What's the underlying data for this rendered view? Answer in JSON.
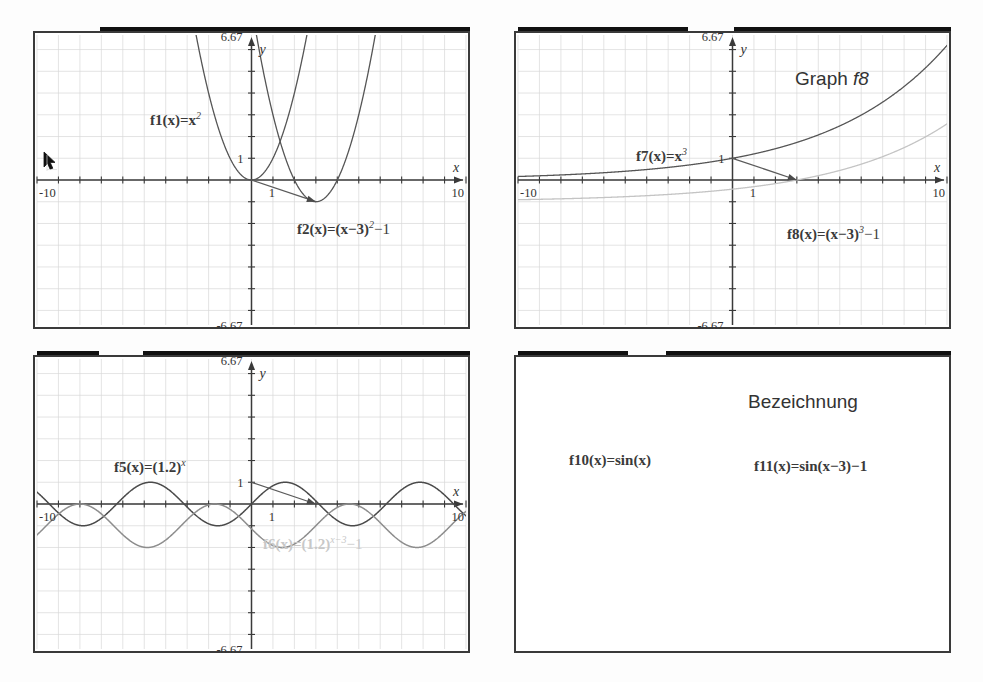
{
  "page": {
    "background": "#fdfdfd",
    "width": 983,
    "height": 682,
    "cursor_icon": "mouse-pointer-icon"
  },
  "axis_defaults": {
    "x_min_label": "-10",
    "x_max_label": "10",
    "y_max_label": "6.67",
    "y_min_label": "-6.67",
    "one_label": "1",
    "x_axis_name": "x",
    "y_axis_name": "y",
    "xlim": [
      -10,
      10
    ],
    "ylim": [
      -6.67,
      6.67
    ],
    "grid": true,
    "grid_step": 1
  },
  "panels": [
    {
      "id": "panel-quadratic",
      "title": "",
      "labels": {
        "f_base": "f1(x)=x",
        "f_base_exp": "2",
        "f_shift_head": "f2(x)=(x−3)",
        "f_shift_exp": "2",
        "f_shift_tail": "−1"
      },
      "chart_data": {
        "type": "line",
        "title": "",
        "xlabel": "x",
        "ylabel": "y",
        "xlim": [
          -10,
          10
        ],
        "ylim": [
          -6.67,
          6.67
        ],
        "grid": true,
        "legend": "inline-annotations",
        "xticks": [
          -10,
          1,
          10
        ],
        "yticks": [
          -6.67,
          1,
          6.67
        ],
        "annotations": [
          {
            "text": "f1(x)=x^2",
            "x": -4.2,
            "y": 4.2
          },
          {
            "text": "f2(x)=(x-3)^2-1",
            "x": 2.2,
            "y": -2.1
          }
        ],
        "arrow": {
          "from": [
            0,
            0
          ],
          "to": [
            3,
            -1
          ],
          "label": "shift vector"
        },
        "series": [
          {
            "name": "f1(x)=x^2",
            "expression": "x^2",
            "color": "#555555",
            "width": 1.3
          },
          {
            "name": "f2(x)=(x-3)^2-1",
            "expression": "(x-3)^2-1",
            "color": "#555555",
            "width": 1.3
          }
        ]
      }
    },
    {
      "id": "panel-cubic",
      "title": "Graph ",
      "title_italic": "f8",
      "labels": {
        "f_base": "f7(x)=x",
        "f_base_exp": "3",
        "f_shift_head": "f8(x)=(x−3)",
        "f_shift_exp": "3",
        "f_shift_tail": "−1"
      },
      "chart_data": {
        "type": "line",
        "title": "Graph f8",
        "xlabel": "x",
        "ylabel": "y",
        "xlim": [
          -10,
          10
        ],
        "ylim": [
          -6.67,
          6.67
        ],
        "grid": true,
        "legend": "inline-annotations",
        "xticks": [
          -10,
          1,
          10
        ],
        "yticks": [
          -6.67,
          6.67
        ],
        "annotations": [
          {
            "text": "f7(x)=x^3",
            "x": -3.4,
            "y": 2.1
          },
          {
            "text": "f8(x)=(x-3)^3-1",
            "x": 2.6,
            "y": -2.2
          }
        ],
        "arrow": {
          "from": [
            0,
            0
          ],
          "to": [
            3,
            -1
          ],
          "label": "shift vector"
        },
        "series": [
          {
            "name": "f7(x)=x^3",
            "expression": "x^3",
            "color": "#666666",
            "width": 1.1
          },
          {
            "name": "f8(x)=(x-3)^3-1",
            "expression": "(x-3)^3-1",
            "color": "#3a3a3a",
            "width": 4.0
          }
        ]
      }
    },
    {
      "id": "panel-exponential",
      "title": "",
      "labels": {
        "f_base": "f5(x)=(1.2)",
        "f_base_exp": "x",
        "f_shift_head": "f6(x)=(1.2)",
        "f_shift_exp": "x−3",
        "f_shift_tail": "−1"
      },
      "chart_data": {
        "type": "line",
        "title": "",
        "xlabel": "x",
        "ylabel": "y",
        "xlim": [
          -10,
          10
        ],
        "ylim": [
          -6.67,
          6.67
        ],
        "grid": true,
        "legend": "inline-annotations",
        "xticks": [
          -10,
          1,
          10
        ],
        "yticks": [
          -6.67,
          1,
          6.67
        ],
        "annotations": [
          {
            "text": "f5(x)=(1.2)^x",
            "x": -5.4,
            "y": 1.9
          },
          {
            "text": "f6(x)=(1.2)^(x-3)-1",
            "x": 0.6,
            "y": -1.9
          }
        ],
        "arrow": {
          "from": [
            0,
            1
          ],
          "to": [
            3,
            0
          ],
          "label": "shift vector"
        },
        "series": [
          {
            "name": "f5(x)=(1.2)^x",
            "expression": "1.2^x",
            "color": "#555555",
            "width": 1.3
          },
          {
            "name": "f6(x)=(1.2)^(x-3)-1",
            "expression": "1.2^(x-3)-1",
            "color": "#c4c4c4",
            "width": 1.3
          }
        ]
      }
    },
    {
      "id": "panel-sine",
      "title": "Bezeichnung",
      "title_italic": "",
      "labels": {
        "f_base": "f10(x)=sin(x)",
        "f_base_exp": "",
        "f_shift_head": "f11(x)=sin(x−3)−1",
        "f_shift_exp": "",
        "f_shift_tail": ""
      },
      "chart_data": {
        "type": "line",
        "title": "Bezeichnung",
        "xlabel": "x",
        "ylabel": "y",
        "xlim": [
          -10,
          10
        ],
        "ylim": [
          -6.67,
          6.67
        ],
        "grid": true,
        "legend": "inline-annotations",
        "xticks": [
          -10,
          1,
          10
        ],
        "yticks": [
          -6.67,
          1,
          6.67
        ],
        "annotations": [
          {
            "text": "f10(x)=sin(x)",
            "x": -7.2,
            "y": 2.2
          },
          {
            "text": "f11(x)=sin(x-3)-1",
            "x": 0.4,
            "y": 1.8
          }
        ],
        "arrow": {
          "from": [
            0,
            1
          ],
          "to": [
            3,
            0
          ],
          "label": "shift vector"
        },
        "series": [
          {
            "name": "f10(x)=sin(x)",
            "expression": "sin(x)",
            "color": "#4a4a4a",
            "width": 1.5
          },
          {
            "name": "f11(x)=sin(x-3)-1",
            "expression": "sin(x-3)-1",
            "color": "#8d8d8d",
            "width": 1.5
          }
        ]
      }
    }
  ]
}
